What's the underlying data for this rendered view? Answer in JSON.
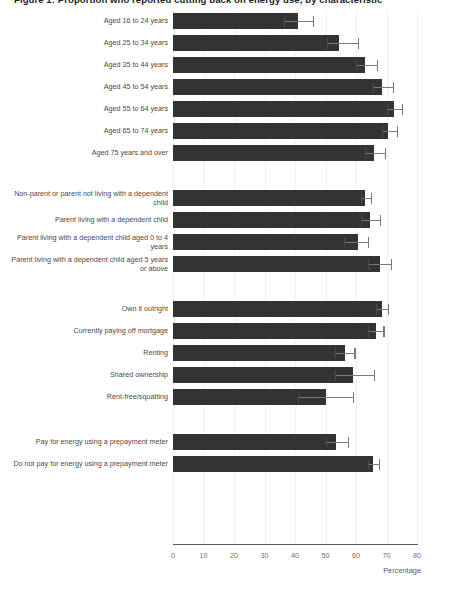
{
  "title": "Figure 1: Proportion who reported cutting back on energy use, by characteristic",
  "axis": {
    "x_label": "Percentage",
    "x_ticks": [
      0,
      10,
      20,
      30,
      40,
      50,
      60,
      70,
      80
    ],
    "x_min": 0,
    "x_max": 80
  },
  "colors": {
    "bar": "#333333",
    "error": "#7a7a7a",
    "grid": "#f0f0f0",
    "axis": "#595959",
    "label": "#4a4a4a"
  },
  "chart_data": {
    "type": "bar",
    "orientation": "horizontal",
    "title": "Figure 1: Proportion who reported cutting back on energy use, by characteristic",
    "xlabel": "Percentage",
    "ylabel": "",
    "xlim": [
      0,
      80
    ],
    "xticks": [
      0,
      10,
      20,
      30,
      40,
      50,
      60,
      70,
      80
    ],
    "grid": true,
    "legend": "none",
    "error_bars": "95% confidence interval",
    "groups": [
      {
        "name": "Age group",
        "items": [
          {
            "label": "Aged 16 to 24 years",
            "value": 41.0,
            "ci_low": 36.5,
            "ci_high": 45.8
          },
          {
            "label": "Aged 25 to 34 years",
            "value": 54.5,
            "ci_low": 50.5,
            "ci_high": 60.5
          },
          {
            "label": "Aged 35 to 44 years",
            "value": 63.0,
            "ci_low": 60.0,
            "ci_high": 67.0
          },
          {
            "label": "Aged 45 to 54 years",
            "value": 68.5,
            "ci_low": 65.5,
            "ci_high": 72.0
          },
          {
            "label": "Aged 55 to 64 years",
            "value": 72.5,
            "ci_low": 70.0,
            "ci_high": 75.0
          },
          {
            "label": "Aged 65 to 74 years",
            "value": 70.5,
            "ci_low": 68.5,
            "ci_high": 73.5
          },
          {
            "label": "Aged 75 years and over",
            "value": 66.0,
            "ci_low": 63.0,
            "ci_high": 69.5
          }
        ]
      },
      {
        "name": "Parental status",
        "items": [
          {
            "label": "Non-parent or parent not living with a dependent child",
            "value": 63.0,
            "ci_low": 61.5,
            "ci_high": 65.0
          },
          {
            "label": "Parent living with a dependent child",
            "value": 64.5,
            "ci_low": 61.5,
            "ci_high": 68.0
          },
          {
            "label": "Parent living with a dependent child aged 0 to 4 years",
            "value": 60.5,
            "ci_low": 56.0,
            "ci_high": 64.0
          },
          {
            "label": "Parent living with a dependent child aged 5 years or above",
            "value": 68.0,
            "ci_low": 64.0,
            "ci_high": 71.5
          }
        ]
      },
      {
        "name": "Housing tenure",
        "items": [
          {
            "label": "Own it outright",
            "value": 68.5,
            "ci_low": 66.5,
            "ci_high": 70.5
          },
          {
            "label": "Currently paying off mortgage",
            "value": 66.5,
            "ci_low": 64.0,
            "ci_high": 69.0
          },
          {
            "label": "Renting",
            "value": 56.5,
            "ci_low": 53.0,
            "ci_high": 59.5
          },
          {
            "label": "Shared ownership",
            "value": 59.0,
            "ci_low": 53.0,
            "ci_high": 66.0
          },
          {
            "label": "Rent-free/squatting",
            "value": 50.0,
            "ci_low": 41.0,
            "ci_high": 59.0
          }
        ]
      },
      {
        "name": "Prepayment meter",
        "items": [
          {
            "label": "Pay for energy using a prepayment meter",
            "value": 53.5,
            "ci_low": 50.0,
            "ci_high": 57.5
          },
          {
            "label": "Do not pay for energy using a prepayment meter",
            "value": 65.5,
            "ci_low": 64.0,
            "ci_high": 67.5
          }
        ]
      }
    ]
  }
}
